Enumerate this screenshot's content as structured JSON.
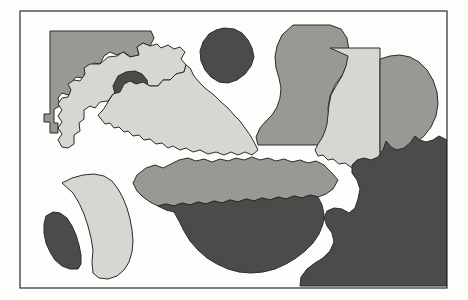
{
  "figure": {
    "description": "Scanned line drawing of irregular overlapping regions filled with three gray tones inside a thin rectangular border",
    "width": 468,
    "height": 300,
    "background_color": "#fdfdfc",
    "outline_color": "#2b2b2b",
    "outline_width": 1
  },
  "palette": {
    "light_gray": "#d6d6d2",
    "medium_gray": "#989894",
    "dark_gray": "#4b4b49",
    "paper": "#fdfdfc",
    "border": "#2b2b2b"
  },
  "frame": {
    "name": "outer-border",
    "x": 20,
    "y": 11,
    "width": 427,
    "height": 277,
    "stroke": "#2b2b2b",
    "stroke_width": 1.2,
    "fill": "none"
  },
  "regions": [
    {
      "id": "region-nw-block",
      "label": "northwest stepped block",
      "tone": "medium_gray",
      "fill": "#989894",
      "points": "50,31 151,31 154,38 150,46 143,43 137,47 139,55 131,57 124,52 117,55 110,52 104,56 100,64 94,63 87,69 83,78 76,77 71,83 73,91 68,95 62,93 58,98 60,106 54,109 54,123 58,123 58,133 50,133 50,122 44,122 44,114 50,114"
    },
    {
      "id": "region-nw-amoeba",
      "label": "northwest light amoeba with lobes",
      "tone": "light_gray",
      "fill": "#d6d6d2",
      "points": "100,64 108,57 117,56 123,52 130,57 139,55 137,47 143,43 150,46 157,44 161,48 168,45 174,49 180,47 185,52 181,59 186,65 184,72 176,74 170,80 163,80 158,86 150,86 143,82 136,84 130,81 124,84 120,92 113,94 108,101 100,102 95,108 90,106 84,110 84,119 79,123 80,131 74,135 74,144 68,148 62,147 58,140 62,134 58,128 62,122 58,116 62,110 58,104 62,98 68,97 71,90 68,84 74,80 80,81 85,74 84,68 90,64"
    },
    {
      "id": "region-nw-dark-blob",
      "label": "dark round blob inside northwest amoeba",
      "tone": "dark_gray",
      "fill": "#4b4b49",
      "points": "118,76 126,72 135,71 142,74 147,80 148,88 145,95 138,100 129,102 121,100 115,94 113,86"
    },
    {
      "id": "region-diagonal-band",
      "label": "light diagonal band running to centre",
      "tone": "light_gray",
      "fill": "#d6d6d2",
      "points": "150,86 158,86 163,80 170,80 176,74 184,72 186,65 190,68 194,76 199,82 206,89 214,95 221,102 228,108 234,115 240,121 245,128 250,135 254,142 258,150 252,155 245,152 238,155 231,152 224,155 216,152 208,154 200,150 193,152 186,148 180,150 173,146 168,148 162,143 156,144 150,139 144,140 139,135 133,136 128,131 124,132 119,127 114,128 110,123 105,124 101,119 98,115 103,110 108,102 113,94 120,92 124,84 130,81 136,84 143,82"
    },
    {
      "id": "region-top-dark-blob",
      "label": "isolated dark round blob top centre",
      "tone": "dark_gray",
      "fill": "#4b4b49",
      "points": "224,28 234,29 242,33 248,40 252,48 254,57 251,66 245,74 237,80 228,83 219,82 211,77 205,70 201,61 200,51 203,42 209,34 216,30"
    },
    {
      "id": "region-s-curve",
      "label": "medium gray S-curve column",
      "tone": "medium_gray",
      "fill": "#989894",
      "points": "293,25 330,25 341,29 347,38 349,50 348,62 343,74 335,85 330,96 328,108 329,122 332,134 334,145 258,145 256,137 260,128 266,121 272,115 277,107 280,98 281,88 279,78 276,68 275,57 277,46 282,35"
    },
    {
      "id": "region-right-rectangle",
      "label": "light gray rectangle right of centre",
      "tone": "light_gray",
      "fill": "#d6d6d2",
      "points": "330,48 380,48 380,170 373,168 366,170 359,166 352,168 345,163 339,164 333,159 328,160 323,155 318,156 315,150 318,144 322,138 325,131 327,124 328,115 329,105 331,95 336,86 342,76 346,66 348,56"
    },
    {
      "id": "region-right-blob",
      "label": "medium gray blob clipped by right border",
      "tone": "medium_gray",
      "fill": "#989894",
      "points": "380,59 390,56 400,55 410,57 419,62 427,70 433,80 437,92 438,104 436,116 431,127 424,136 415,144 405,150 394,153 385,153 380,152"
    },
    {
      "id": "region-mid-lobed-band",
      "label": "medium gray lobed horizontal band",
      "tone": "medium_gray",
      "fill": "#989894",
      "points": "137,175 146,168 155,165 163,168 171,164 179,160 188,158 196,161 204,159 212,162 220,159 228,161 236,158 244,160 252,157 260,160 268,158 276,161 284,159 292,162 300,160 308,163 316,161 324,165 331,172 338,180 333,189 326,194 318,197 310,195 302,198 294,196 286,199 278,197 270,200 262,198 254,201 246,199 238,202 230,200 222,203 214,201 206,204 198,202 190,205 182,203 174,206 166,204 158,206 150,202 143,197 137,191 133,183"
    },
    {
      "id": "region-bottom-dark-bowl",
      "label": "dark gray bowl shaped mass bottom centre",
      "tone": "dark_gray",
      "fill": "#4b4b49",
      "points": "158,206 166,204 174,206 182,203 190,205 198,202 206,204 214,201 222,203 230,200 238,202 246,199 254,201 262,198 270,200 278,197 286,199 294,196 302,198 310,195 318,197 322,205 324,214 323,224 319,234 313,243 305,251 296,258 286,264 275,269 263,272 251,273 239,272 228,269 217,264 207,258 198,250 190,241 184,231 179,221 174,212 166,210"
    },
    {
      "id": "region-sw-fan",
      "label": "light gray fan wedge bottom left",
      "tone": "light_gray",
      "fill": "#d6d6d2",
      "points": "62,183 72,178 83,175 94,174 104,176 112,181 118,189 123,198 127,208 130,219 132,230 133,241 132,252 129,262 124,270 117,276 108,279 99,278 93,273 92,262 93,250 91,238 88,226 84,214 79,203 73,193"
    },
    {
      "id": "region-sw-crescent",
      "label": "small dark crescent bottom left",
      "tone": "dark_gray",
      "fill": "#4b4b49",
      "points": "46,216 53,212 60,213 67,218 72,226 76,235 79,245 81,255 81,264 78,269 70,269 62,266 55,260 50,252 46,243 44,233 44,224"
    },
    {
      "id": "region-se-mass",
      "label": "large dark gray mass bottom right corner",
      "tone": "dark_gray",
      "fill": "#4b4b49",
      "points": "447,140 447,286 300,286 301,277 307,269 315,263 323,258 330,251 334,242 332,233 327,226 324,218 327,211 334,208 342,209 349,213 355,208 358,199 360,189 357,180 352,173 352,165 357,160 364,158 371,160 378,157 383,150 386,141 391,147 397,150 404,148 410,143 415,136 420,140 426,142 433,140 439,136"
    }
  ],
  "legend": {
    "tone_count": 3,
    "tones": [
      {
        "name": "light gray",
        "hex": "#d6d6d2"
      },
      {
        "name": "medium gray",
        "hex": "#989894"
      },
      {
        "name": "dark gray",
        "hex": "#4b4b49"
      }
    ]
  }
}
